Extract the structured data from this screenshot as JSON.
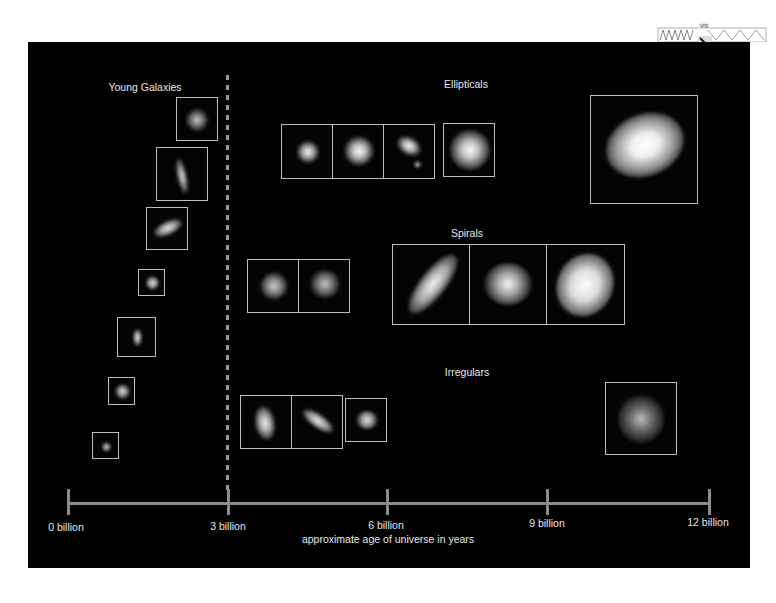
{
  "figure": {
    "background_color": "#000000",
    "text_color": "#e6e6e6",
    "frame_color": "#bdbdbd",
    "axis_color": "#8c8c8c"
  },
  "sections": {
    "young": {
      "title": "Young Galaxies"
    },
    "ellipticals": {
      "title": "Ellipticals"
    },
    "spirals": {
      "title": "Spirals"
    },
    "irregulars": {
      "title": "Irregulars"
    }
  },
  "axis": {
    "caption": "approximate age of universe in years",
    "ticks": [
      {
        "label": "0 billion",
        "value": 0
      },
      {
        "label": "3 billion",
        "value": 3
      },
      {
        "label": "6 billion",
        "value": 6
      },
      {
        "label": "9 billion",
        "value": 9
      },
      {
        "label": "12 billion",
        "value": 12
      }
    ]
  },
  "corner_badge": {
    "icon": "logo-badge-icon",
    "text": "VIS"
  },
  "galaxy_frames": {
    "young_count": 7,
    "elliptical_count": 5,
    "spiral_count": 5,
    "irregular_count": 4
  }
}
